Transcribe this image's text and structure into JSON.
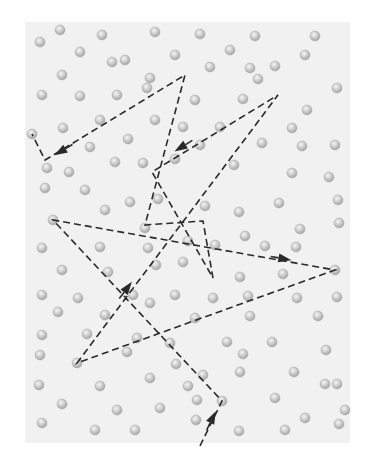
{
  "diagram": {
    "colors": {
      "background": "#ffffff",
      "panel": "#f1f1f1",
      "sphere_fill": "#c8c8c8",
      "sphere_highlight": "#f4f4f4",
      "sphere_edge": "#a9a9a9",
      "path": "#2a2a2a"
    },
    "panel": {
      "x": 25,
      "y": 22,
      "width": 325,
      "height": 421
    },
    "path": {
      "style": "dashed",
      "points": [
        [
          200,
          446
        ],
        [
          222,
          401
        ],
        [
          53,
          220
        ],
        [
          335,
          270
        ],
        [
          77,
          363
        ],
        [
          278,
          95
        ],
        [
          152,
          172
        ],
        [
          213,
          278
        ],
        [
          203,
          221
        ],
        [
          145,
          225
        ],
        [
          185,
          75
        ],
        [
          45,
          160
        ],
        [
          32,
          134
        ]
      ],
      "arrows": [
        {
          "at": [
            213,
            417
          ],
          "from": [
            200,
            446
          ],
          "to": [
            222,
            401
          ]
        },
        {
          "at": [
            285,
            259
          ],
          "from": [
            53,
            220
          ],
          "to": [
            335,
            270
          ]
        },
        {
          "at": [
            128,
            287
          ],
          "from": [
            77,
            363
          ],
          "to": [
            278,
            95
          ]
        },
        {
          "at": [
            180,
            148
          ],
          "from": [
            278,
            95
          ],
          "to": [
            152,
            172
          ]
        },
        {
          "at": [
            60,
            152
          ],
          "from": [
            185,
            75
          ],
          "to": [
            45,
            160
          ]
        }
      ]
    },
    "molecules": [
      [
        40,
        42
      ],
      [
        60,
        30
      ],
      [
        102,
        35
      ],
      [
        155,
        32
      ],
      [
        200,
        34
      ],
      [
        255,
        36
      ],
      [
        315,
        36
      ],
      [
        80,
        52
      ],
      [
        125,
        60
      ],
      [
        175,
        55
      ],
      [
        230,
        50
      ],
      [
        250,
        68
      ],
      [
        305,
        55
      ],
      [
        62,
        75
      ],
      [
        112,
        62
      ],
      [
        150,
        78
      ],
      [
        210,
        67
      ],
      [
        258,
        79
      ],
      [
        275,
        66
      ],
      [
        337,
        88
      ],
      [
        42,
        95
      ],
      [
        80,
        96
      ],
      [
        117,
        95
      ],
      [
        147,
        88
      ],
      [
        195,
        100
      ],
      [
        243,
        99
      ],
      [
        307,
        110
      ],
      [
        100,
        120
      ],
      [
        63,
        128
      ],
      [
        155,
        120
      ],
      [
        183,
        127
      ],
      [
        220,
        127
      ],
      [
        292,
        128
      ],
      [
        32,
        134
      ],
      [
        90,
        147
      ],
      [
        128,
        139
      ],
      [
        200,
        145
      ],
      [
        262,
        143
      ],
      [
        302,
        146
      ],
      [
        335,
        145
      ],
      [
        47,
        168
      ],
      [
        69,
        172
      ],
      [
        115,
        162
      ],
      [
        143,
        163
      ],
      [
        175,
        159
      ],
      [
        234,
        165
      ],
      [
        292,
        173
      ],
      [
        329,
        177
      ],
      [
        45,
        188
      ],
      [
        85,
        190
      ],
      [
        130,
        202
      ],
      [
        158,
        199
      ],
      [
        205,
        206
      ],
      [
        239,
        212
      ],
      [
        279,
        203
      ],
      [
        338,
        200
      ],
      [
        53,
        220
      ],
      [
        105,
        210
      ],
      [
        145,
        228
      ],
      [
        188,
        241
      ],
      [
        245,
        236
      ],
      [
        300,
        229
      ],
      [
        339,
        223
      ],
      [
        42,
        248
      ],
      [
        100,
        247
      ],
      [
        148,
        248
      ],
      [
        215,
        245
      ],
      [
        265,
        246
      ],
      [
        296,
        247
      ],
      [
        62,
        270
      ],
      [
        108,
        272
      ],
      [
        156,
        265
      ],
      [
        183,
        262
      ],
      [
        240,
        277
      ],
      [
        283,
        274
      ],
      [
        335,
        270
      ],
      [
        42,
        295
      ],
      [
        78,
        298
      ],
      [
        133,
        295
      ],
      [
        175,
        295
      ],
      [
        213,
        298
      ],
      [
        248,
        296
      ],
      [
        297,
        298
      ],
      [
        337,
        297
      ],
      [
        58,
        312
      ],
      [
        105,
        315
      ],
      [
        150,
        303
      ],
      [
        195,
        318
      ],
      [
        250,
        316
      ],
      [
        318,
        316
      ],
      [
        42,
        335
      ],
      [
        87,
        334
      ],
      [
        137,
        338
      ],
      [
        170,
        343
      ],
      [
        227,
        342
      ],
      [
        272,
        342
      ],
      [
        326,
        350
      ],
      [
        40,
        355
      ],
      [
        77,
        363
      ],
      [
        127,
        352
      ],
      [
        176,
        364
      ],
      [
        203,
        375
      ],
      [
        243,
        354
      ],
      [
        294,
        372
      ],
      [
        39,
        385
      ],
      [
        100,
        386
      ],
      [
        150,
        378
      ],
      [
        188,
        386
      ],
      [
        240,
        372
      ],
      [
        325,
        384
      ],
      [
        337,
        384
      ],
      [
        62,
        404
      ],
      [
        117,
        410
      ],
      [
        160,
        408
      ],
      [
        197,
        400
      ],
      [
        222,
        401
      ],
      [
        275,
        398
      ],
      [
        345,
        410
      ],
      [
        42,
        423
      ],
      [
        95,
        430
      ],
      [
        135,
        430
      ],
      [
        196,
        420
      ],
      [
        239,
        431
      ],
      [
        285,
        430
      ],
      [
        305,
        418
      ],
      [
        339,
        424
      ]
    ]
  }
}
